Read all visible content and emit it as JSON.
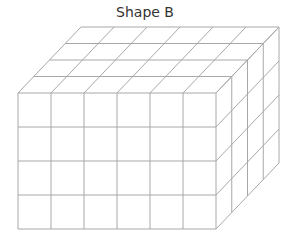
{
  "title": "Shape B",
  "shape": {
    "type": "cuboid-of-unit-cubes",
    "columns": 6,
    "rows": 4,
    "depth": 4,
    "line_color": "#a8a8a8",
    "background": "#ffffff"
  },
  "geometry": {
    "front_left": 18,
    "front_top": 93,
    "cell_w": 33,
    "cell_h": 34,
    "depth_dx": 15.75,
    "depth_dy": -16.5
  }
}
